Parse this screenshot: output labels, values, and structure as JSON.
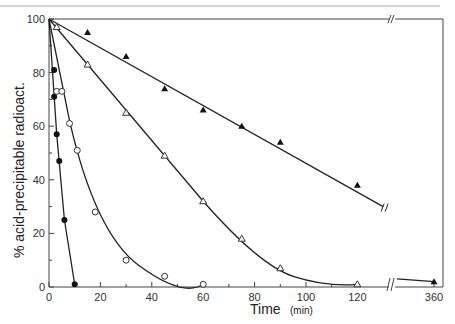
{
  "chart_data": {
    "type": "line",
    "title": "",
    "xlabel": "Time",
    "xlabel_unit": "(min)",
    "ylabel": "% acid-precipitable radioact.",
    "xlim": [
      0,
      360
    ],
    "ylim": [
      0,
      100
    ],
    "x_axis_break": [
      130,
      350
    ],
    "x_ticks": [
      0,
      20,
      40,
      60,
      80,
      100,
      120,
      360
    ],
    "x_minor_ticks": [
      10,
      30,
      50,
      70,
      90,
      110
    ],
    "y_ticks": [
      0,
      20,
      40,
      60,
      80,
      100
    ],
    "y_minor_ticks": [
      10,
      30,
      50,
      70,
      90
    ],
    "grid": false,
    "legend": "none",
    "series": [
      {
        "name": "filled circles",
        "marker": "filled-circle",
        "x": [
          0,
          2,
          2,
          3,
          4,
          6,
          10
        ],
        "y": [
          100,
          81,
          71,
          57,
          47,
          25,
          1
        ]
      },
      {
        "name": "open circles",
        "marker": "open-circle",
        "x": [
          0,
          3,
          5,
          8,
          11,
          18,
          30,
          45,
          60
        ],
        "y": [
          100,
          73,
          73,
          61,
          51,
          28,
          10,
          4,
          1
        ]
      },
      {
        "name": "open triangles",
        "marker": "open-triangle",
        "x": [
          0,
          3,
          15,
          30,
          45,
          60,
          75,
          90,
          120
        ],
        "y": [
          100,
          97,
          83,
          65,
          49,
          32,
          18,
          7,
          1
        ]
      },
      {
        "name": "filled triangles",
        "marker": "filled-triangle",
        "x": [
          0,
          15,
          30,
          45,
          60,
          75,
          90,
          120,
          360
        ],
        "y": [
          100,
          95,
          86,
          74,
          66,
          60,
          54,
          38,
          2
        ]
      }
    ]
  },
  "labels": {
    "xlabel": "Time",
    "xunit": "(min)",
    "ylabel": "% acid-precipitable radioact.",
    "x_ticks": [
      "0",
      "20",
      "40",
      "60",
      "80",
      "100",
      "120",
      "360"
    ],
    "y_ticks": [
      "0",
      "20",
      "40",
      "60",
      "80",
      "100"
    ]
  }
}
